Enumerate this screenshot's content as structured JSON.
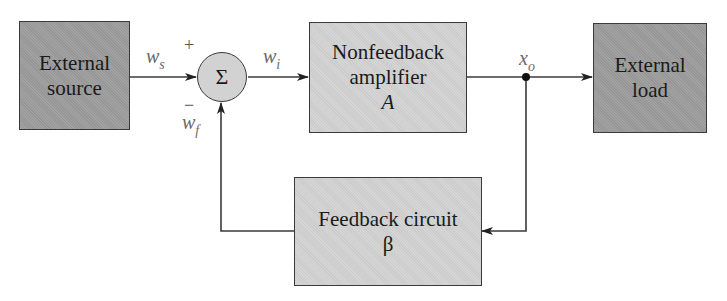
{
  "diagram": {
    "type": "feedback-amplifier-block-diagram",
    "blocks": {
      "external_source": {
        "line1": "External",
        "line2": "source"
      },
      "amplifier": {
        "line1": "Nonfeedback",
        "line2": "amplifier",
        "symbol": "A"
      },
      "external_load": {
        "line1": "External",
        "line2": "load"
      },
      "feedback": {
        "line1": "Feedback circuit",
        "symbol": "β"
      }
    },
    "summer": {
      "symbol": "Σ",
      "plus": "+",
      "minus": "−"
    },
    "signals": {
      "ws": {
        "base": "w",
        "sub": "s"
      },
      "wi": {
        "base": "w",
        "sub": "i"
      },
      "wf": {
        "base": "w",
        "sub": "f"
      },
      "xo": {
        "base": "x",
        "sub": "o"
      }
    },
    "colors": {
      "external_fill": "#9c9c9c",
      "internal_fill": "#d2d2d2",
      "line": "#3a3a3a",
      "label": "#6a6a6a"
    }
  }
}
